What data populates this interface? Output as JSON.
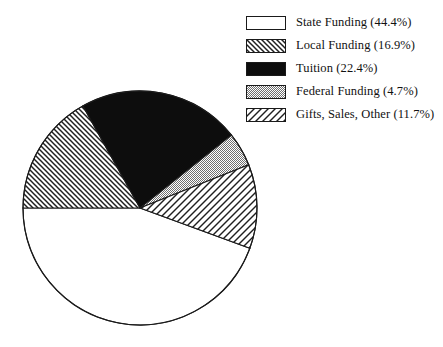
{
  "chart_data": {
    "type": "pie",
    "title": "",
    "subtitle": "",
    "xlabel": "",
    "ylabel": "",
    "grid": false,
    "legend_position": "top-right",
    "start_angle_deg": 180,
    "direction": "clockwise",
    "center": {
      "x": 140,
      "y": 208
    },
    "radius": 117,
    "categories": [
      "State Funding",
      "Local Funding",
      "Tuition",
      "Federal Funding",
      "Gifts, Sales, Other"
    ],
    "values": [
      44.4,
      16.9,
      22.4,
      4.7,
      11.7
    ],
    "value_unit": "%",
    "slices": [
      {
        "label": "State Funding",
        "value": 44.4,
        "value_text": "44.4%",
        "legend_text": "State Funding (44.4%)",
        "fill": "white",
        "color": "#ffffff",
        "angle_deg": 159.8,
        "start_deg": -20.1,
        "end_deg": -180.0
      },
      {
        "label": "Local Funding",
        "value": 16.9,
        "value_text": "16.9%",
        "legend_text": "Local Funding (16.9%)",
        "fill": "hatch-backslash-dense",
        "color": "#222222",
        "angle_deg": 60.8,
        "start_deg": 180.0,
        "end_deg": 119.2
      },
      {
        "label": "Tuition",
        "value": 22.4,
        "value_text": "22.4%",
        "legend_text": "Tuition (22.4%)",
        "fill": "solid-black",
        "color": "#0d0d0d",
        "angle_deg": 80.6,
        "start_deg": 119.2,
        "end_deg": 38.6
      },
      {
        "label": "Federal Funding",
        "value": 4.7,
        "value_text": "4.7%",
        "legend_text": "Federal Funding (4.7%)",
        "fill": "solid-gray",
        "color": "#a8a8a8",
        "angle_deg": 16.9,
        "start_deg": 38.6,
        "end_deg": 21.7
      },
      {
        "label": "Gifts, Sales, Other",
        "value": 11.7,
        "value_text": "11.7%",
        "legend_text": "Gifts, Sales, Other (11.7%)",
        "fill": "hatch-slash-wide",
        "color": "#222222",
        "angle_deg": 42.1,
        "start_deg": 21.7,
        "end_deg": -20.1
      }
    ]
  },
  "legend": {
    "items": [
      {
        "swatch": "white-swatch",
        "label": "State Funding (44.4%)"
      },
      {
        "swatch": "hatch-backslash-swatch",
        "label": "Local Funding (16.9%)"
      },
      {
        "swatch": "black-swatch",
        "label": "Tuition (22.4%)"
      },
      {
        "swatch": "gray-swatch",
        "label": "Federal Funding (4.7%)"
      },
      {
        "swatch": "hatch-slash-swatch",
        "label": "Gifts, Sales, Other (11.7%)"
      }
    ]
  },
  "colors": {
    "outline": "#1a1a1a",
    "black": "#0d0d0d",
    "gray": "#a8a8a8",
    "white": "#ffffff",
    "text": "#111111"
  }
}
